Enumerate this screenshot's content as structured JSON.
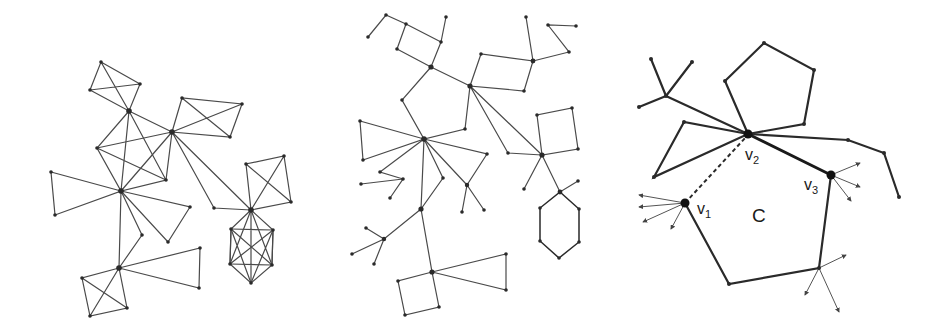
{
  "figure": {
    "panels": [
      {
        "id": "left",
        "description": "Graph composed of complete subgraphs (K4 cliques, triangles, octahedron K2,2,2) joined at cut vertices"
      },
      {
        "id": "middle",
        "description": "Graph of cycles (squares, pentagon, triangles, hexagon) and trees joined at cut vertices"
      },
      {
        "id": "right",
        "description": "Cycle C with marked vertices v1, v2, v3 and a dashed chord v1–v2"
      }
    ],
    "labels": {
      "v1_main": "v",
      "v1_sub": "1",
      "v2_main": "v",
      "v2_sub": "2",
      "v3_main": "v",
      "v3_sub": "3",
      "cycle": "C"
    }
  }
}
